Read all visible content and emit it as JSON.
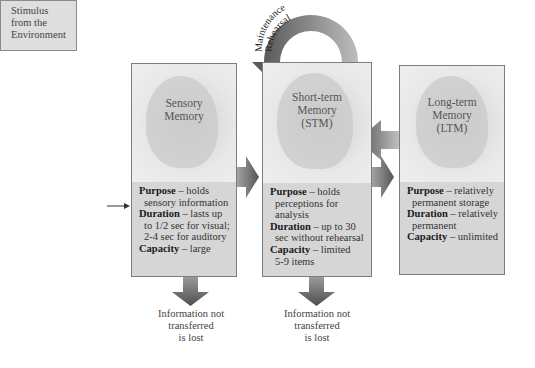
{
  "stimulus": {
    "lines": [
      "Stimulus",
      "from the",
      "Environment"
    ]
  },
  "rehearsal_loop": {
    "label_line1": "Maintenance",
    "label_line2": "Rehearsal"
  },
  "boxes": [
    {
      "id": "sensory",
      "title": [
        "Sensory",
        "Memory"
      ],
      "purpose_label": "Purpose",
      "purpose_text": "– holds",
      "purpose_cont": [
        "sensory information"
      ],
      "duration_label": "Duration",
      "duration_text": " – lasts up",
      "duration_cont": [
        "to 1/2 sec for visual;",
        "2-4 sec for auditory"
      ],
      "capacity_label": "Capacity",
      "capacity_text": "– large",
      "capacity_cont": []
    },
    {
      "id": "stm",
      "title": [
        "Short-term",
        "Memory",
        "(STM)"
      ],
      "purpose_label": "Purpose",
      "purpose_text": "– holds",
      "purpose_cont": [
        "perceptions for",
        "analysis"
      ],
      "duration_label": "Duration",
      "duration_text": " – up to 30",
      "duration_cont": [
        "sec without rehearsal"
      ],
      "capacity_label": "Capacity",
      "capacity_text": "– limited",
      "capacity_cont": [
        "5-9 items"
      ]
    },
    {
      "id": "ltm",
      "title": [
        "Long-term",
        "Memory",
        "(LTM)"
      ],
      "purpose_label": "Purpose",
      "purpose_text": "– relatively",
      "purpose_cont": [
        "permanent storage"
      ],
      "duration_label": "Duration",
      "duration_text": " – relatively",
      "duration_cont": [
        "permanent"
      ],
      "capacity_label": "Capacity",
      "capacity_text": "– unlimited",
      "capacity_cont": []
    }
  ],
  "loss_notes": [
    {
      "lines": [
        "Information not",
        "transferred",
        "is lost"
      ]
    },
    {
      "lines": [
        "Information not",
        "transferred",
        "is lost"
      ]
    }
  ],
  "colors": {
    "arrow_dark": "#5a5a5a",
    "arrow_light": "#c8c8c8",
    "box_fill": "#d9d9d9",
    "border": "#7d7d7d"
  }
}
